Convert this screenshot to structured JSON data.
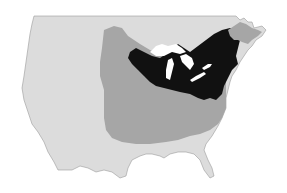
{
  "map": {
    "region": "North America (contiguous United States and southern Canada)",
    "background_color": "#ffffff",
    "layers": [
      {
        "id": "base-land",
        "label": "Land (unhighlighted)",
        "color": "#dcdcdc"
      },
      {
        "id": "range-outer",
        "label": "Medium gray region (central and eastern US)",
        "color": "#a6a6a6"
      },
      {
        "id": "range-core",
        "label": "Black region (Great Lakes and Northeast)",
        "color": "#111111"
      },
      {
        "id": "northeast-tip",
        "label": "Medium gray region (northern New England / Maritimes)",
        "color": "#a6a6a6"
      },
      {
        "id": "great-lakes",
        "label": "Great Lakes (water)",
        "color": "#ffffff"
      }
    ],
    "labels": []
  }
}
